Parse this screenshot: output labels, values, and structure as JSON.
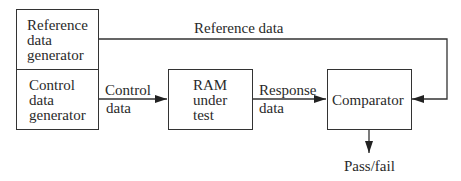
{
  "diagram": {
    "blocks": {
      "reference_generator": {
        "lines": [
          "Reference",
          "data",
          "generator"
        ]
      },
      "control_generator": {
        "lines": [
          "Control",
          "data",
          "generator"
        ]
      },
      "ram": {
        "lines": [
          "RAM",
          "under",
          "test"
        ]
      },
      "comparator": {
        "label": "Comparator"
      }
    },
    "edges": {
      "reference_data": "Reference data",
      "control_data": {
        "lines": [
          "Control",
          "data"
        ]
      },
      "response_data": {
        "lines": [
          "Response",
          "data"
        ]
      },
      "pass_fail": "Pass/fail"
    }
  }
}
